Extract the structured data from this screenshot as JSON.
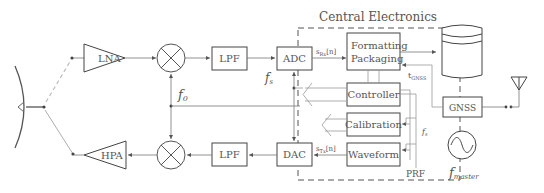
{
  "title": "Central Electronics",
  "blocks": {
    "lna": "LNA",
    "hpa": "HPA",
    "lpf_rx": "LPF",
    "lpf_tx": "LPF",
    "adc": "ADC",
    "dac": "DAC",
    "formatting_line1": "Formatting",
    "formatting_line2": "Packaging",
    "controller": "Controller",
    "calibration": "Calibration",
    "waveform": "Waveform",
    "gnss": "GNSS"
  },
  "signals": {
    "f0": "f",
    "f0_sub": "0",
    "fs": "f",
    "fs_sub": "s",
    "fs_right": "f",
    "fs_right_sub": "s",
    "s_rx": "s",
    "s_rx_sub": "Rx",
    "s_rx_arg": "[n]",
    "s_tx": "s",
    "s_tx_sub": "Tx",
    "s_tx_arg": "[n]",
    "t_gnss": "t",
    "t_gnss_sub": "GNSS",
    "prf": "PRF",
    "f_master": "f",
    "f_master_sub": "master"
  },
  "icons": [
    "reflector-antenna-icon",
    "mixer-icon",
    "storage-icon",
    "gnss-antenna-icon",
    "oscillator-icon"
  ]
}
